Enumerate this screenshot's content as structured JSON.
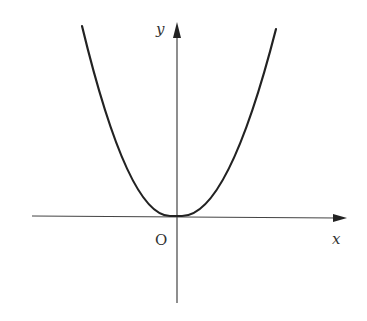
{
  "diagram": {
    "type": "function-graph",
    "axes": {
      "x_label": "x",
      "y_label": "y",
      "origin_label": "O"
    },
    "curve": {
      "shape": "parabola",
      "vertex": "origin",
      "opens": "up"
    },
    "colors": {
      "line": "#222222",
      "axis": "#444444",
      "background": "#ffffff"
    }
  }
}
